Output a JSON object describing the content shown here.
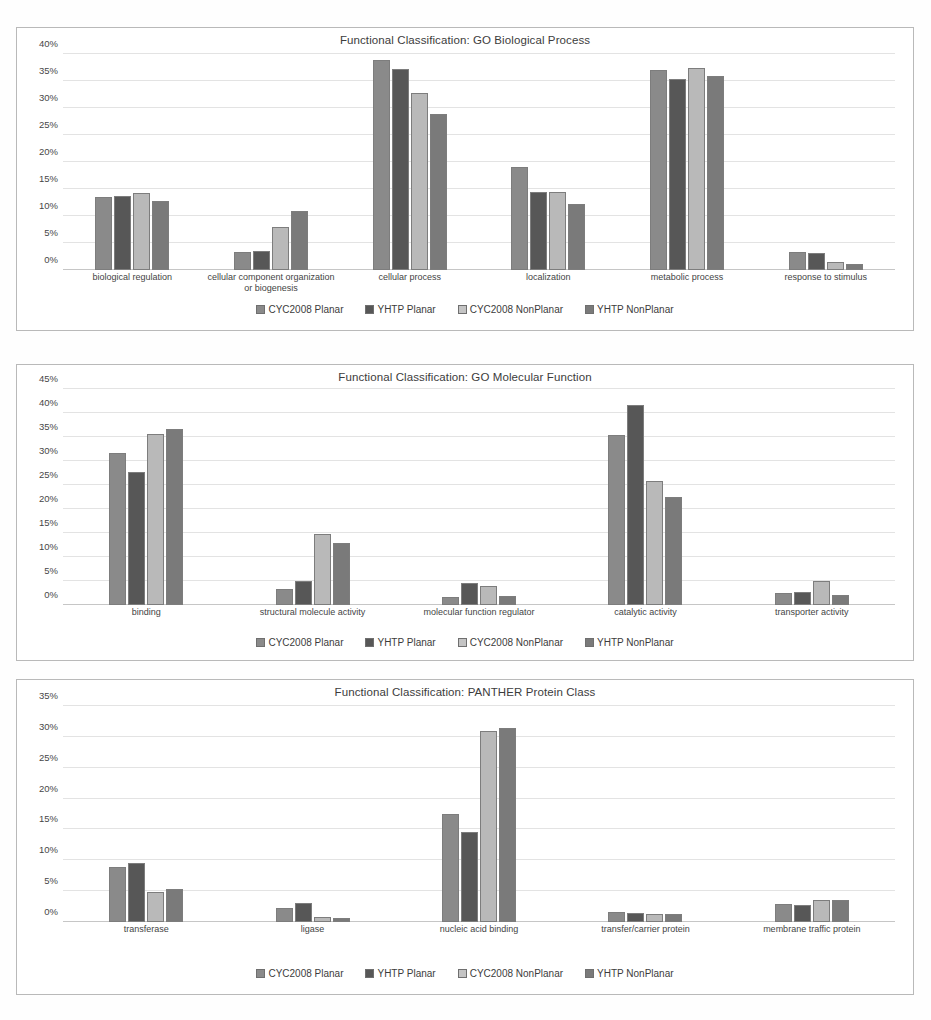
{
  "series_names": [
    "CYC2008 Planar",
    "YHTP Planar",
    "CYC2008 NonPlanar",
    "YHTP NonPlanar"
  ],
  "colors": {
    "series_0": "#8a8a8a",
    "series_1": "#575757",
    "series_2": "#b9b9b9",
    "series_3": "#7a7a7a",
    "gridline": "#e3e3e3",
    "panel_border": "#b9b9b9",
    "text": "#3c3c3c"
  },
  "charts": [
    {
      "title": "Functional Classification: GO Biological Process",
      "ytick_labels": [
        "40%",
        "35%",
        "30%",
        "25%",
        "20%",
        "15%",
        "10%",
        "5%",
        "0%"
      ],
      "legend": [
        "CYC2008 Planar",
        "YHTP Planar",
        "CYC2008 NonPlanar",
        "YHTP NonPlanar"
      ]
    },
    {
      "title": "Functional Classification: GO Molecular Function",
      "ytick_labels": [
        "45%",
        "40%",
        "35%",
        "30%",
        "25%",
        "20%",
        "15%",
        "10%",
        "5%",
        "0%"
      ],
      "legend": [
        "CYC2008 Planar",
        "YHTP Planar",
        "CYC2008 NonPlanar",
        "YHTP NonPlanar"
      ]
    },
    {
      "title": "Functional Classification: PANTHER Protein Class",
      "ytick_labels": [
        "35%",
        "30%",
        "25%",
        "20%",
        "15%",
        "10%",
        "5%",
        "0%"
      ],
      "legend": [
        "CYC2008 Planar",
        "YHTP Planar",
        "CYC2008 NonPlanar",
        "YHTP NonPlanar"
      ]
    }
  ],
  "chart_data": [
    {
      "type": "bar",
      "title": "Functional Classification: GO Biological Process",
      "xlabel": "",
      "ylabel": "",
      "ylim": [
        0,
        40
      ],
      "yticks": [
        0,
        5,
        10,
        15,
        20,
        25,
        30,
        35,
        40
      ],
      "ytick_labels": [
        "0%",
        "5%",
        "10%",
        "15%",
        "20%",
        "25%",
        "30%",
        "35%",
        "40%"
      ],
      "grid": true,
      "legend_position": "bottom",
      "categories": [
        "biological regulation",
        "cellular component organization or biogenesis",
        "cellular process",
        "localization",
        "metabolic process",
        "response to stimulus"
      ],
      "series": [
        {
          "name": "CYC2008 Planar",
          "values": [
            13.5,
            3.4,
            38.9,
            19.0,
            37.0,
            3.3
          ]
        },
        {
          "name": "YHTP Planar",
          "values": [
            13.7,
            3.6,
            37.3,
            14.4,
            35.4,
            3.1
          ]
        },
        {
          "name": "CYC2008 NonPlanar",
          "values": [
            14.3,
            8.0,
            32.7,
            14.4,
            37.4,
            1.4
          ]
        },
        {
          "name": "YHTP NonPlanar",
          "values": [
            12.8,
            11.0,
            28.9,
            12.3,
            36.0,
            1.2
          ]
        }
      ]
    },
    {
      "type": "bar",
      "title": "Functional Classification: GO Molecular Function",
      "xlabel": "",
      "ylabel": "",
      "ylim": [
        0,
        45
      ],
      "yticks": [
        0,
        5,
        10,
        15,
        20,
        25,
        30,
        35,
        40,
        45
      ],
      "ytick_labels": [
        "0%",
        "5%",
        "10%",
        "15%",
        "20%",
        "25%",
        "30%",
        "35%",
        "40%",
        "45%"
      ],
      "grid": true,
      "legend_position": "bottom",
      "categories": [
        "binding",
        "structural molecule activity",
        "molecular function regulator",
        "catalytic activity",
        "transporter activity"
      ],
      "series": [
        {
          "name": "CYC2008 Planar",
          "values": [
            31.7,
            3.4,
            1.7,
            35.4,
            2.5
          ]
        },
        {
          "name": "YHTP Planar",
          "values": [
            27.8,
            5.0,
            4.5,
            41.7,
            2.7
          ]
        },
        {
          "name": "CYC2008 NonPlanar",
          "values": [
            35.6,
            14.8,
            4.0,
            25.9,
            4.9
          ]
        },
        {
          "name": "YHTP NonPlanar",
          "values": [
            36.6,
            13.0,
            1.8,
            22.6,
            2.0
          ]
        }
      ]
    },
    {
      "type": "bar",
      "title": "Functional Classification: PANTHER Protein Class",
      "xlabel": "",
      "ylabel": "",
      "ylim": [
        0,
        35
      ],
      "yticks": [
        0,
        5,
        10,
        15,
        20,
        25,
        30,
        35
      ],
      "ytick_labels": [
        "0%",
        "5%",
        "10%",
        "15%",
        "20%",
        "25%",
        "30%",
        "35%"
      ],
      "grid": true,
      "legend_position": "bottom",
      "categories": [
        "transferase",
        "ligase",
        "nucleic acid binding",
        "transfer/carrier protein",
        "membrane traffic protein"
      ],
      "series": [
        {
          "name": "CYC2008 Planar",
          "values": [
            8.9,
            2.3,
            17.5,
            1.7,
            3.0
          ]
        },
        {
          "name": "YHTP Planar",
          "values": [
            9.6,
            3.1,
            14.6,
            1.5,
            2.7
          ]
        },
        {
          "name": "CYC2008 NonPlanar",
          "values": [
            4.9,
            0.8,
            31.0,
            1.3,
            3.6
          ]
        },
        {
          "name": "YHTP NonPlanar",
          "values": [
            5.4,
            0.6,
            31.4,
            1.3,
            3.5
          ]
        }
      ]
    }
  ]
}
